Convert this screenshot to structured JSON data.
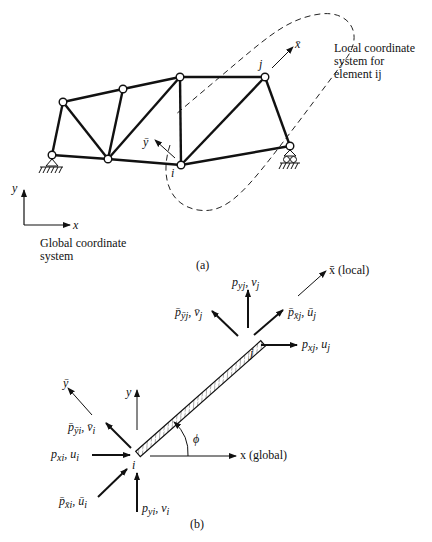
{
  "figure_a": {
    "caption": "(a)",
    "local_label_line1": "Local coordinate",
    "local_label_line2": "system for",
    "local_label_line3": "element ij",
    "global_label_line1": "Global coordinate",
    "global_label_line2": "system",
    "axis_x": "x",
    "axis_y": "y",
    "local_axis_x": "x̄",
    "local_axis_y": "ȳ",
    "node_i": "i",
    "node_j": "j",
    "nodes": [
      {
        "id": "A",
        "x": 52,
        "y": 155,
        "support": "pin"
      },
      {
        "id": "B",
        "x": 63,
        "y": 102
      },
      {
        "id": "C",
        "x": 123,
        "y": 89
      },
      {
        "id": "D",
        "x": 180,
        "y": 77
      },
      {
        "id": "E",
        "x": 108,
        "y": 159
      },
      {
        "id": "i",
        "x": 181,
        "y": 165
      },
      {
        "id": "j",
        "x": 265,
        "y": 77
      },
      {
        "id": "F",
        "x": 290,
        "y": 146,
        "support": "roller"
      }
    ],
    "members": [
      [
        "A",
        "B"
      ],
      [
        "B",
        "C"
      ],
      [
        "C",
        "D"
      ],
      [
        "D",
        "j"
      ],
      [
        "A",
        "E"
      ],
      [
        "E",
        "i"
      ],
      [
        "i",
        "F"
      ],
      [
        "j",
        "F"
      ],
      [
        "B",
        "E"
      ],
      [
        "C",
        "E"
      ],
      [
        "E",
        "D"
      ],
      [
        "D",
        "i"
      ],
      [
        "i",
        "j"
      ]
    ]
  },
  "figure_b": {
    "caption": "(b)",
    "node_i": "i",
    "node_j": "j",
    "angle": "ϕ",
    "x_global": "x (global)",
    "x_local": "x̄ (local)",
    "y_axis": "y",
    "y_local": "ȳ",
    "forces_j": {
      "pyj_vj": "p",
      "pyj_sub": "yj",
      "pyj_disp": ", v",
      "pyj_disp_sub": "j",
      "pbar_yj": "p̄",
      "pbar_yj_sub": "ȳj",
      "pbar_yj_disp": ", v̄",
      "pbar_yj_disp_sub": "j",
      "pbar_xj": "p̄",
      "pbar_xj_sub": "x̄j",
      "pbar_xj_disp": ", ū",
      "pbar_xj_disp_sub": "j",
      "pxj": "p",
      "pxj_sub": "xj",
      "pxj_disp": ", u",
      "pxj_disp_sub": "j"
    },
    "forces_i": {
      "pbar_yi": "p̄",
      "pbar_yi_sub": "ȳi",
      "pbar_yi_disp": ", v̄",
      "pbar_yi_disp_sub": "i",
      "pxi": "p",
      "pxi_sub": "xi",
      "pxi_disp": ", u",
      "pxi_disp_sub": "i",
      "pbar_xi": "p̄",
      "pbar_xi_sub": "x̄i",
      "pbar_xi_disp": ", ū",
      "pbar_xi_disp_sub": "i",
      "pyi": "p",
      "pyi_sub": "yi",
      "pyi_disp": ", v",
      "pyi_disp_sub": "i"
    }
  }
}
